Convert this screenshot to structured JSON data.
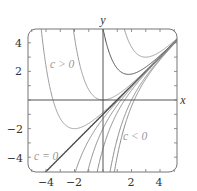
{
  "chart_data": {
    "type": "line",
    "title": "",
    "equation": "y = x - 1 + c e^(-x)",
    "xlabel": "x",
    "ylabel": "y",
    "xlim": [
      -5.25,
      5.25
    ],
    "ylim": [
      -5,
      5
    ],
    "grid": false,
    "x_ticks": [
      -4,
      -2,
      2,
      4
    ],
    "x_tick_labels": [
      "−4",
      "−2",
      "2",
      "4"
    ],
    "y_ticks": [
      4,
      2,
      -2,
      -4
    ],
    "y_tick_labels": [
      "4",
      "2",
      "−2",
      "−4"
    ],
    "series": [
      {
        "name": "c = e^-2",
        "c": 0.135,
        "color": "#9a9a9a",
        "group": "c > 0"
      },
      {
        "name": "c = 1",
        "c": 1,
        "color": "#9a9a9a",
        "group": "c > 0"
      },
      {
        "name": "c = e^1.8",
        "c": 6.0,
        "color": "#4a4a4a",
        "group": "c > 0"
      },
      {
        "name": "c = e^3",
        "c": 20,
        "color": "#9a9a9a",
        "group": "c > 0"
      },
      {
        "name": "c = 0",
        "c": 0,
        "color": "#4a4a4a",
        "group": "c = 0"
      },
      {
        "name": "c = -0.3",
        "c": -0.3,
        "color": "#8a8a8a",
        "group": "c < 0"
      },
      {
        "name": "c = -1",
        "c": -1,
        "color": "#8a8a8a",
        "group": "c < 0"
      },
      {
        "name": "c = -2.4",
        "c": -2.4,
        "color": "#8a8a8a",
        "group": "c < 0"
      },
      {
        "name": "c = -7.4",
        "c": -7.4,
        "color": "#8a8a8a",
        "group": "c < 0"
      },
      {
        "name": "c = -10.7",
        "c": -10.7,
        "color": "#8a8a8a",
        "group": "c < 0"
      }
    ],
    "annotations": [
      {
        "text": "c > 0",
        "x": -3.1,
        "y": 2.55
      },
      {
        "text": "c < 0",
        "x": 2.5,
        "y": -2.5
      },
      {
        "text": "c = 0",
        "x": -4.8,
        "y": -3.95
      }
    ]
  },
  "labels": {
    "x_axis": "x",
    "y_axis": "y",
    "annot_c_pos": "c > 0",
    "annot_c_neg": "c < 0",
    "annot_c_zero": "c = 0"
  },
  "colors": {
    "frame": "#555555",
    "axes": "#555555",
    "dark_curve": "#4a4a4a",
    "light_curve": "#9a9a9a"
  }
}
